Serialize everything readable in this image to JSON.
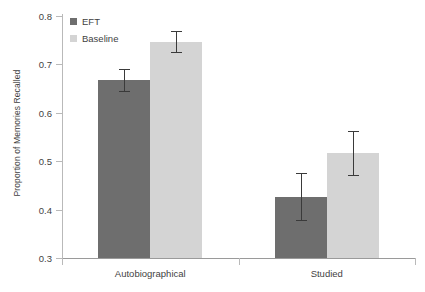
{
  "chart_data": {
    "type": "bar",
    "title": "",
    "xlabel": "",
    "ylabel": "Proportion of Memories Recalled",
    "categories": [
      "Autobiographical",
      "Studied"
    ],
    "ylim": [
      0.3,
      0.8
    ],
    "yticks": [
      0.3,
      0.4,
      0.5,
      0.6,
      0.7,
      0.8
    ],
    "ytick_labels": [
      "0.3",
      "0.4",
      "0.5",
      "0.6",
      "0.7",
      "0.8"
    ],
    "grid": false,
    "legend_position": "top-left",
    "series": [
      {
        "name": "EFT",
        "color": "#6e6e6e",
        "values": [
          0.668,
          0.427
        ],
        "errors": [
          0.022,
          0.048
        ]
      },
      {
        "name": "Baseline",
        "color": "#d4d4d4",
        "values": [
          0.747,
          0.517
        ],
        "errors": [
          0.021,
          0.045
        ]
      }
    ]
  },
  "legend": {
    "items": [
      {
        "label": "EFT",
        "color": "#6e6e6e"
      },
      {
        "label": "Baseline",
        "color": "#d4d4d4"
      }
    ]
  },
  "axes": {
    "y_title": "Proportion of Memories Recalled",
    "y_labels": [
      "0.8",
      "0.7",
      "0.6",
      "0.5",
      "0.4",
      "0.3"
    ],
    "x_labels": [
      "Autobiographical",
      "Studied"
    ]
  },
  "colors": {
    "eft": "#6e6e6e",
    "baseline": "#d4d4d4",
    "axis": "#b9b9b9",
    "error": "#3a3a3a",
    "text": "#3f3f3f",
    "background": "#ffffff"
  }
}
